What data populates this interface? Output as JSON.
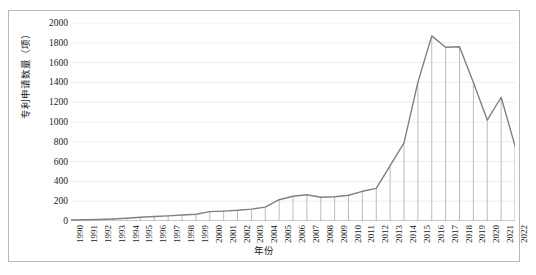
{
  "chart_data": {
    "type": "line",
    "title": "",
    "xlabel": "年份",
    "ylabel": "专利申请数量（项）",
    "categories": [
      "1990",
      "1991",
      "1992",
      "1993",
      "1994",
      "1995",
      "1996",
      "1997",
      "1998",
      "1999",
      "2000",
      "2001",
      "2002",
      "2003",
      "2004",
      "2005",
      "2006",
      "2007",
      "2008",
      "2009",
      "2010",
      "2011",
      "2012",
      "2013",
      "2014",
      "2015",
      "2016",
      "2017",
      "2018",
      "2019",
      "2020",
      "2021",
      "2022"
    ],
    "values": [
      10,
      12,
      15,
      20,
      28,
      38,
      45,
      52,
      60,
      68,
      95,
      100,
      108,
      120,
      140,
      215,
      250,
      265,
      240,
      245,
      260,
      300,
      330,
      560,
      790,
      1400,
      1870,
      1755,
      1760,
      1400,
      1020,
      1250,
      760
    ],
    "ylim": [
      0,
      2000
    ],
    "ytick_values": [
      0,
      200,
      400,
      600,
      800,
      1000,
      1200,
      1400,
      1600,
      1800,
      2000
    ],
    "grid": true,
    "legend": "none",
    "series_color": "#808080",
    "grid_color": "#e8e8e8",
    "drop_lines": true
  }
}
